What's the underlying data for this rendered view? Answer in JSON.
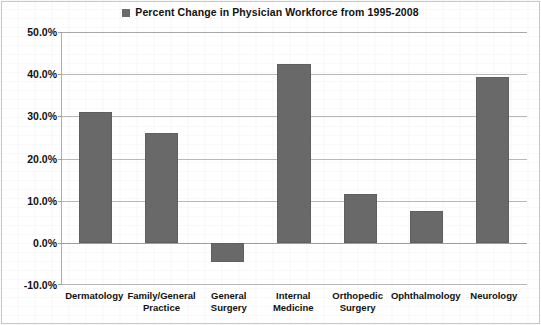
{
  "legend": {
    "marker_icon": "legend-square-icon",
    "marker_color": "#6a6a6a",
    "label": "Percent Change in Physician Workforce from 1995-2008"
  },
  "axes": {
    "y_ticks": [
      "50.0%",
      "40.0%",
      "30.0%",
      "20.0%",
      "10.0%",
      "0.0%",
      "-10.0%"
    ]
  },
  "chart_data": {
    "type": "bar",
    "title": "Percent Change in Physician Workforce from 1995-2008",
    "xlabel": "",
    "ylabel": "",
    "ylim": [
      -10,
      50
    ],
    "ytick_step": 10,
    "ytick_format": "percent_one_decimal",
    "grid": true,
    "legend_position": "top-center",
    "series_name": "Percent Change in Physician Workforce from 1995-2008",
    "bar_color": "#696969",
    "categories": [
      "Dermatology",
      "Family/General Practice",
      "General Surgery",
      "Internal Medicine",
      "Orthopedic Surgery",
      "Ophthalmology",
      "Neurology"
    ],
    "values": [
      31.0,
      26.0,
      -4.5,
      42.5,
      11.5,
      7.5,
      39.3
    ],
    "value_labels": [
      "31.0%",
      "26.0%",
      "-4.5%",
      "42.5%",
      "11.5%",
      "7.5%",
      "39.3%"
    ]
  }
}
